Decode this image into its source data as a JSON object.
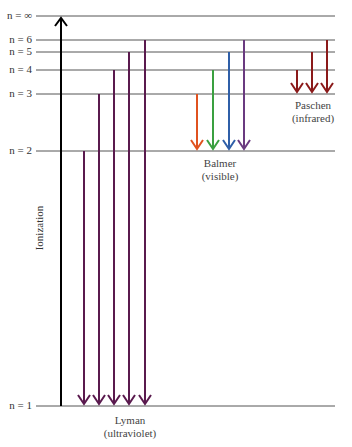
{
  "levels": [
    {
      "n": "∞",
      "label": "n = ∞",
      "y": 16
    },
    {
      "n": "6",
      "label": "n = 6",
      "y": 40
    },
    {
      "n": "5",
      "label": "n = 5",
      "y": 52
    },
    {
      "n": "4",
      "label": "n = 4",
      "y": 70
    },
    {
      "n": "3",
      "label": "n = 3",
      "y": 94
    },
    {
      "n": "2",
      "label": "n = 2",
      "y": 151
    },
    {
      "n": "1",
      "label": "n = 1",
      "y": 406
    }
  ],
  "ionization": {
    "label": "Ionization",
    "color": "#000000"
  },
  "series": {
    "lyman": {
      "name": "Lyman",
      "region": "(ultraviolet)",
      "color": "#5a1a4e"
    },
    "balmer": {
      "name": "Balmer",
      "region": "(visible)",
      "colors": [
        "#e0521f",
        "#3aa040",
        "#2f5fa8",
        "#6a3a80"
      ]
    },
    "paschen": {
      "name": "Paschen",
      "region": "(infrared)",
      "color": "#8b1a1a"
    }
  }
}
